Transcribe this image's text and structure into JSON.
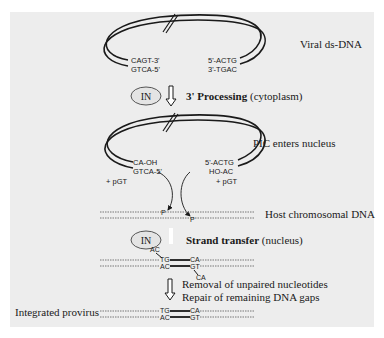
{
  "figure": {
    "background_color": "#ededed",
    "stroke_color": "#1a1a1a",
    "viral_dna": {
      "label": "Viral ds-DNA",
      "left_end_top": "CAGT-3'",
      "left_end_bottom": "GTCA-5'",
      "right_end_top": "5'-ACTG",
      "right_end_bottom": "3'-TGAC"
    },
    "step1": {
      "enzyme": "IN",
      "title_bold": "3' Processing",
      "title_rest": " (cytoplasm)"
    },
    "pic": {
      "label": "PIC enters nucleus",
      "left_end_top": "CA-OH",
      "left_end_bottom": "GTCA-5'",
      "right_end_top": "5'-ACTG",
      "right_end_bottom": "HO-AC",
      "left_byproduct": "+ pGT",
      "right_byproduct": "+ pGT"
    },
    "host_dna": {
      "label": "Host chromosomal DNA",
      "phosphate_marker": "P"
    },
    "step2": {
      "enzyme": "IN",
      "title_bold": "Strand transfer",
      "title_rest": " (nucleus)",
      "overhang_top": "AC",
      "left_top": "TG",
      "left_bottom": "AC",
      "right_top": "CA",
      "right_bottom": "GT",
      "overhang_bottom": "CA"
    },
    "step3": {
      "line1": "Removal of unpaired nucleotides",
      "line2": "Repair of remaining DNA gaps"
    },
    "provirus": {
      "label": "Integrated provirus",
      "left_top": "TG",
      "left_bottom": "AC",
      "right_top": "CA",
      "right_bottom": "GT"
    }
  }
}
